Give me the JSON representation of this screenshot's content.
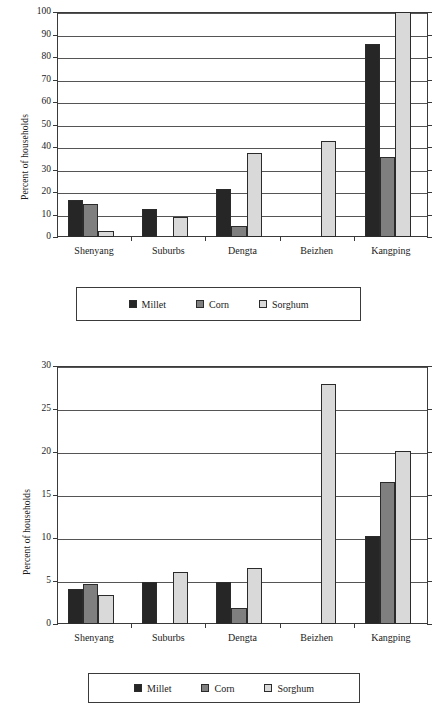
{
  "chart_data": [
    {
      "type": "bar",
      "title": "",
      "chart_index": 1,
      "xlabel": "",
      "ylabel": "Percent of households",
      "ylim": [
        0,
        100
      ],
      "ytick_labels": [
        "0",
        "10",
        "20",
        "30",
        "40",
        "50",
        "60",
        "70",
        "80",
        "90",
        "100"
      ],
      "ytick_values": [
        0,
        10,
        20,
        30,
        40,
        50,
        60,
        70,
        80,
        90,
        100
      ],
      "grid": true,
      "legend_position": "below",
      "categories": [
        "Shenyang",
        "Suburbs",
        "Dengta",
        "Beizhen",
        "Kangping"
      ],
      "series": [
        {
          "name": "Millet",
          "color": "#262626",
          "values": [
            16.3,
            12.4,
            21.2,
            0,
            85.6
          ]
        },
        {
          "name": "Corn",
          "color": "#7f7f7f",
          "values": [
            14.6,
            0,
            4.9,
            0,
            35.5
          ]
        },
        {
          "name": "Sorghum",
          "color": "#d9d9d9",
          "values": [
            2.8,
            9.1,
            37.4,
            42.7,
            100.0
          ]
        }
      ]
    },
    {
      "type": "bar",
      "title": "",
      "chart_index": 2,
      "xlabel": "",
      "ylabel": "Percent of households",
      "ylim": [
        0,
        30
      ],
      "ytick_labels": [
        "0",
        "5",
        "10",
        "15",
        "20",
        "25",
        "30"
      ],
      "ytick_values": [
        0,
        5,
        10,
        15,
        20,
        25,
        30
      ],
      "grid": true,
      "legend_position": "below",
      "categories": [
        "Shenyang",
        "Suburbs",
        "Dengta",
        "Beizhen",
        "Kangping"
      ],
      "series": [
        {
          "name": "Millet",
          "color": "#262626",
          "values": [
            4.1,
            4.9,
            4.9,
            0,
            10.2
          ]
        },
        {
          "name": "Corn",
          "color": "#7f7f7f",
          "values": [
            4.7,
            0,
            1.9,
            0,
            16.5
          ]
        },
        {
          "name": "Sorghum",
          "color": "#d9d9d9",
          "values": [
            3.4,
            6.0,
            6.5,
            27.9,
            20.1
          ]
        }
      ]
    }
  ],
  "figures": [
    {
      "id": "figure-1",
      "y_axis_title": "Percent of households",
      "legend": [
        {
          "label": "Millet",
          "color": "#262626"
        },
        {
          "label": "Corn",
          "color": "#7f7f7f"
        },
        {
          "label": "Sorghum",
          "color": "#d9d9d9"
        }
      ]
    },
    {
      "id": "figure-2",
      "y_axis_title": "Percent of households",
      "legend": [
        {
          "label": "Millet",
          "color": "#262626"
        },
        {
          "label": "Corn",
          "color": "#7f7f7f"
        },
        {
          "label": "Sorghum",
          "color": "#d9d9d9"
        }
      ]
    }
  ]
}
